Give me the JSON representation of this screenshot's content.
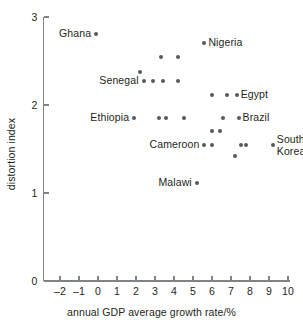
{
  "chart_data": {
    "type": "scatter",
    "title": "",
    "xlabel": "annual GDP average growth rate/%",
    "ylabel": "distortion index",
    "xlim": [
      -2.8,
      10.4
    ],
    "ylim": [
      0,
      3
    ],
    "grid": false,
    "legend": "none",
    "x_ticks": [
      -2,
      -1,
      0,
      1,
      2,
      3,
      4,
      5,
      6,
      7,
      8,
      9,
      10
    ],
    "x_tick_labels": [
      "–2",
      "–1",
      "0",
      "1",
      "2",
      "3",
      "4",
      "5",
      "6",
      "7",
      "8",
      "9",
      "10"
    ],
    "y_ticks": [
      0,
      1,
      2,
      3
    ],
    "y_tick_labels": [
      "0",
      "1",
      "2",
      "3"
    ],
    "points": [
      {
        "x": -0.1,
        "y": 2.81,
        "label": "Ghana",
        "label_side": "left"
      },
      {
        "x": 5.6,
        "y": 2.71,
        "label": "Nigeria",
        "label_side": "right"
      },
      {
        "x": 3.3,
        "y": 2.55,
        "label": "",
        "label_side": ""
      },
      {
        "x": 4.2,
        "y": 2.55,
        "label": "",
        "label_side": ""
      },
      {
        "x": 2.2,
        "y": 2.38,
        "label": "",
        "label_side": ""
      },
      {
        "x": 2.4,
        "y": 2.27,
        "label": "Senegal",
        "label_side": "left"
      },
      {
        "x": 2.9,
        "y": 2.27,
        "label": "",
        "label_side": ""
      },
      {
        "x": 3.4,
        "y": 2.27,
        "label": "",
        "label_side": ""
      },
      {
        "x": 4.2,
        "y": 2.27,
        "label": "",
        "label_side": ""
      },
      {
        "x": 6.0,
        "y": 2.11,
        "label": "",
        "label_side": ""
      },
      {
        "x": 6.8,
        "y": 2.11,
        "label": "",
        "label_side": ""
      },
      {
        "x": 7.3,
        "y": 2.11,
        "label": "Egypt",
        "label_side": "right"
      },
      {
        "x": 1.9,
        "y": 1.85,
        "label": "Ethiopia",
        "label_side": "left"
      },
      {
        "x": 3.2,
        "y": 1.85,
        "label": "",
        "label_side": ""
      },
      {
        "x": 3.6,
        "y": 1.85,
        "label": "",
        "label_side": ""
      },
      {
        "x": 4.5,
        "y": 1.85,
        "label": "",
        "label_side": ""
      },
      {
        "x": 6.6,
        "y": 1.85,
        "label": "",
        "label_side": ""
      },
      {
        "x": 7.4,
        "y": 1.85,
        "label": "Brazil",
        "label_side": "right"
      },
      {
        "x": 6.0,
        "y": 1.71,
        "label": "",
        "label_side": ""
      },
      {
        "x": 6.4,
        "y": 1.71,
        "label": "",
        "label_side": ""
      },
      {
        "x": 5.6,
        "y": 1.54,
        "label": "Cameroon",
        "label_side": "left"
      },
      {
        "x": 6.0,
        "y": 1.54,
        "label": "",
        "label_side": ""
      },
      {
        "x": 7.5,
        "y": 1.54,
        "label": "",
        "label_side": ""
      },
      {
        "x": 7.8,
        "y": 1.54,
        "label": "",
        "label_side": ""
      },
      {
        "x": 9.2,
        "y": 1.54,
        "label": "South\nKorea",
        "label_side": "right"
      },
      {
        "x": 7.2,
        "y": 1.42,
        "label": "",
        "label_side": ""
      },
      {
        "x": 5.2,
        "y": 1.11,
        "label": "Malawi",
        "label_side": "left"
      }
    ]
  },
  "colors": {
    "point": "#58595b",
    "axis": "#808285",
    "text": "#231f20",
    "background": "#ffffff"
  }
}
